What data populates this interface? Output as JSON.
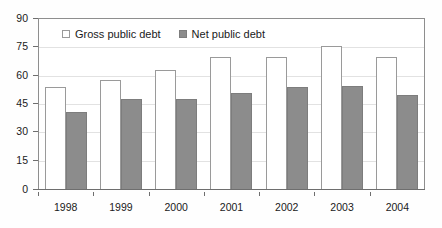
{
  "chart_data": {
    "type": "bar",
    "title": "",
    "subtitle": "",
    "xlabel": "",
    "ylabel": "",
    "categories": [
      "1998",
      "1999",
      "2000",
      "2001",
      "2002",
      "2003",
      "2004"
    ],
    "series": [
      {
        "name": "Gross public debt",
        "values": [
          54,
          58,
          63,
          70,
          70,
          76,
          70
        ],
        "color": "#ffffff",
        "border_color": "#9a9a9a"
      },
      {
        "name": "Net public debt",
        "values": [
          41,
          48,
          48,
          51,
          54,
          55,
          50
        ],
        "color": "#8c8c8c",
        "border_color": "#7d7d7d"
      }
    ],
    "ylim": [
      0,
      90
    ],
    "yticks": [
      0,
      15,
      30,
      45,
      60,
      75,
      90
    ],
    "ytick_labels": [
      "0",
      "15",
      "30",
      "45",
      "60",
      "75",
      "90"
    ],
    "grid": true,
    "grid_axis": "y",
    "legend_position": "top-left-inside",
    "annotations": []
  },
  "legend": {
    "items": [
      {
        "label": "Gross public debt",
        "swatch": "hollow-square-icon"
      },
      {
        "label": "Net public debt",
        "swatch": "filled-square-icon"
      }
    ]
  },
  "colors": {
    "gross_fill": "#ffffff",
    "gross_border": "#9a9a9a",
    "net_fill": "#8c8c8c",
    "net_border": "#7d7d7d",
    "axis": "#6e6e6e",
    "grid": "#e2e2e2",
    "text": "#1a1a1a",
    "background": "#ffffff"
  }
}
